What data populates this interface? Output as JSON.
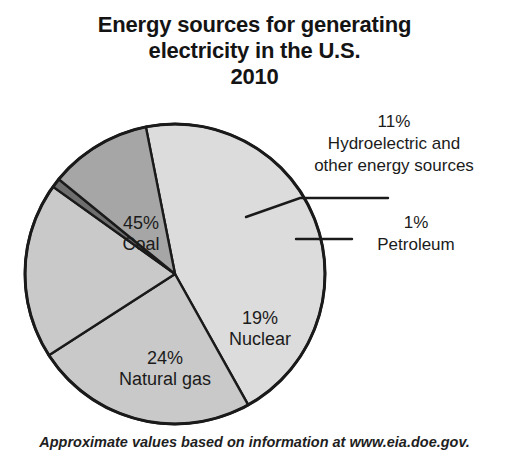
{
  "title": {
    "line1": "Energy sources for generating",
    "line2": "electricity in the U.S.",
    "line3": "2010"
  },
  "footnote": "Approximate values based on information at www.eia.doe.gov.",
  "labels": {
    "coal": {
      "pct": "45%",
      "name": "Coal"
    },
    "natgas": {
      "pct": "24%",
      "name": "Natural gas"
    },
    "nuclear": {
      "pct": "19%",
      "name": "Nuclear"
    },
    "hydro": {
      "pct": "11%",
      "name_line1": "Hydroelectric and",
      "name_line2": "other energy sources"
    },
    "petro": {
      "pct": "1%",
      "name": "Petroleum"
    }
  },
  "colors": {
    "coal": "#dcdcdc",
    "natural_gas": "#c9c9c9",
    "nuclear": "#c9c9c9",
    "hydroelectric": "#a6a6a6",
    "petroleum": "#6e6e6e",
    "outline": "#1a1a1a",
    "background": "#ffffff",
    "text": "#1b1b1b"
  },
  "chart_data": {
    "type": "pie",
    "title": "Energy sources for generating electricity in the U.S. 2010",
    "subtitle": "2010",
    "note": "Approximate values based on information at www.eia.doe.gov.",
    "unit": "percent",
    "total": 100,
    "legend": "none (labels placed on and around slices)",
    "categories": [
      "Coal",
      "Natural gas",
      "Nuclear",
      "Hydroelectric and other energy sources",
      "Petroleum"
    ],
    "values": [
      45,
      24,
      19,
      11,
      1
    ],
    "slices": [
      {
        "label": "Coal",
        "value": 45,
        "display": "45%",
        "color": "#dcdcdc",
        "label_position": "inside"
      },
      {
        "label": "Natural gas",
        "value": 24,
        "display": "24%",
        "color": "#c9c9c9",
        "label_position": "inside"
      },
      {
        "label": "Nuclear",
        "value": 19,
        "display": "19%",
        "color": "#c9c9c9",
        "label_position": "inside"
      },
      {
        "label": "Hydroelectric and other energy sources",
        "value": 11,
        "display": "11%",
        "color": "#a6a6a6",
        "label_position": "outside-leader"
      },
      {
        "label": "Petroleum",
        "value": 1,
        "display": "1%",
        "color": "#6e6e6e",
        "label_position": "outside-leader"
      }
    ]
  },
  "geometry": {
    "center_x": 175,
    "center_y": 274,
    "radius": 150
  }
}
